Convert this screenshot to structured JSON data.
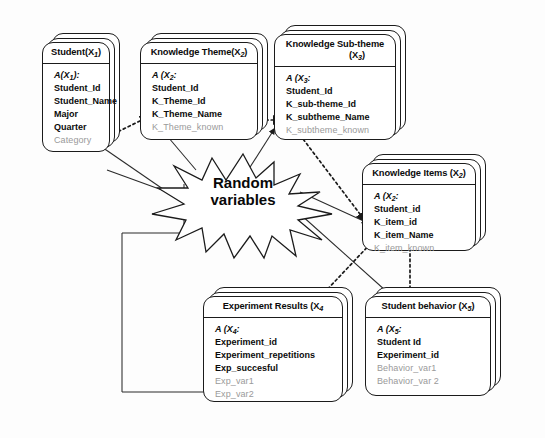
{
  "diagram": {
    "center_label_line1": "Random",
    "center_label_line2": "variables",
    "ink_color": "#1b1b1b",
    "faded_color": "#9a9a9a",
    "background": "#fdfdfd"
  },
  "entities": [
    {
      "id": "student",
      "title": "Student(X",
      "title_sub": "1",
      "title_tail": ")",
      "attr_head": "A(X",
      "attr_head_sub": "1",
      "attr_head_tail": "):",
      "fields": [
        {
          "label": "Student_Id",
          "faded": false
        },
        {
          "label": "Student_Name",
          "faded": false
        },
        {
          "label": "Major",
          "faded": false
        },
        {
          "label": "Quarter",
          "faded": false
        },
        {
          "label": "Category",
          "faded": true
        }
      ]
    },
    {
      "id": "knowledge-theme",
      "title": "Knowledge Theme(X",
      "title_sub": "2",
      "title_tail": ")",
      "attr_head": "A (X",
      "attr_head_sub": "2",
      "attr_head_tail": ":",
      "fields": [
        {
          "label": "Student_Id",
          "faded": false
        },
        {
          "label": "K_Theme_Id",
          "faded": false
        },
        {
          "label": "K_Theme_Name",
          "faded": false
        },
        {
          "label": "K_Theme_known",
          "faded": true
        }
      ]
    },
    {
      "id": "knowledge-subtheme",
      "title": "Knowledge Sub-theme",
      "title_line2_pre": "(X",
      "title_sub": "3",
      "title_line2_post": ")",
      "attr_head": "A (X",
      "attr_head_sub": "3",
      "attr_head_tail": ":",
      "fields": [
        {
          "label": "Student_Id",
          "faded": false
        },
        {
          "label": "K_sub-theme_Id",
          "faded": false
        },
        {
          "label": "K_subtheme_Name",
          "faded": false
        },
        {
          "label": "K_subtheme_known",
          "faded": true
        }
      ]
    },
    {
      "id": "knowledge-items",
      "title": "Knowledge Items (X",
      "title_sub": "2",
      "title_tail": ")",
      "attr_head": "A (X",
      "attr_head_sub": "2",
      "attr_head_tail": ":",
      "fields": [
        {
          "label": "Student_id",
          "faded": false
        },
        {
          "label": "K_item_id",
          "faded": false
        },
        {
          "label": "K_item_Name",
          "faded": false
        },
        {
          "label": "K_item_known",
          "faded": true
        }
      ]
    },
    {
      "id": "experiment-results",
      "title": "Experiment Results (X",
      "title_sub": "4",
      "title_tail": "",
      "attr_head": "A (X",
      "attr_head_sub": "4",
      "attr_head_tail": ":",
      "fields": [
        {
          "label": "Experiment_id",
          "faded": false
        },
        {
          "label": "Experiment_repetitions",
          "faded": false
        },
        {
          "label": "Exp_succesful",
          "faded": false
        },
        {
          "label": "Exp_var1",
          "faded": true
        },
        {
          "label": "Exp_var2",
          "faded": true
        }
      ]
    },
    {
      "id": "student-behavior",
      "title": "Student behavior (X",
      "title_sub": "5",
      "title_tail": ")",
      "attr_head": "A (X",
      "attr_head_sub": "5",
      "attr_head_tail": ":",
      "fields": [
        {
          "label": "Student Id",
          "faded": false
        },
        {
          "label": "Experiment_id",
          "faded": false
        },
        {
          "label": "Behavior_var1",
          "faded": true
        },
        {
          "label": "Behavior_var 2",
          "faded": true
        }
      ]
    }
  ]
}
